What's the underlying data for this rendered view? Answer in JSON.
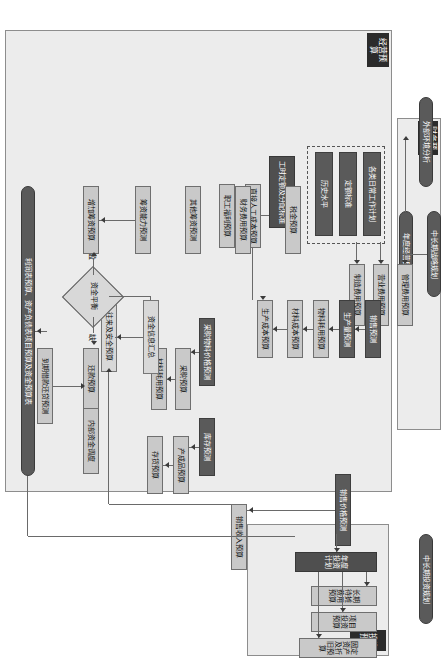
{
  "diagram": {
    "orientation": "landscape content rotated 90 degrees clockwise",
    "groups": {
      "operating_budget": "经营预算",
      "financial_budget": "财务预算",
      "investment_budget": "投资预算"
    },
    "inputs": {
      "external_env": "外部环境分析",
      "midlong_strategy": "中长期战略规划",
      "annual_goal": "年度经营目标",
      "midlong_invest": "中长期投资规划"
    },
    "basis_box": {
      "daily_plans": "各类日常工作计划",
      "quota_standard": "定额标准",
      "history_level": "历史水平"
    },
    "expense_budgets": {
      "admin": "管理费用预算",
      "selling": "营业费用预算",
      "manufacturing": "制造费用预算"
    },
    "labor": {
      "hour_quota": "工时定额及分配标准",
      "direct_labor": "直接人工成本预算",
      "welfare": "职工福利预算"
    },
    "operating_chain": {
      "sales_forecast": "销售预测",
      "output_forecast": "生产量预测",
      "material_use": "物料耗用预算",
      "material_cost": "材料成本预算",
      "production_cost": "生产成本预算",
      "price_forecast": "采购物料价格预测",
      "purchase_budget": "采购预算",
      "material_consume": "材料耗用预算",
      "inventory_forecast": "库存预测",
      "finished_goods": "产成品预算",
      "stock_budget": "存货预算",
      "sales_price_forecast": "销售价格预测",
      "sales_revenue": "销售收入预算",
      "receivable": "往来及安全预算"
    },
    "financial": {
      "cash_summary": "资金信息汇总",
      "balance_decision": "资金平衡",
      "surplus_label": "盈",
      "deficit_label": "缺",
      "financing_capacity": "筹资能力预测",
      "other_financing": "其他筹资预测",
      "add_financing": "增加筹资预算",
      "repay_budget": "还款预算",
      "due_loan_forecast": "到期借款还贷预测",
      "internal_dispatch": "内部资金调度",
      "financial_expense": "财务费用预算",
      "tax_budget": "税金预算"
    },
    "investment": {
      "annual_plan": "年度投资计划",
      "longterm_amortize": "长期待摊费用预算",
      "project_invest": "项目投资预算",
      "fixed_asset": "固定资产及折旧预算"
    },
    "output": {
      "final": "利润表预算、资产负债表项目预算及资金预算表"
    },
    "colors": {
      "dark_node": "#5a5a5a",
      "light_node": "#c9c9c9",
      "group_bg": "#ececec",
      "title_bg": "#2b2b2b",
      "line": "#6a6a6a"
    }
  }
}
